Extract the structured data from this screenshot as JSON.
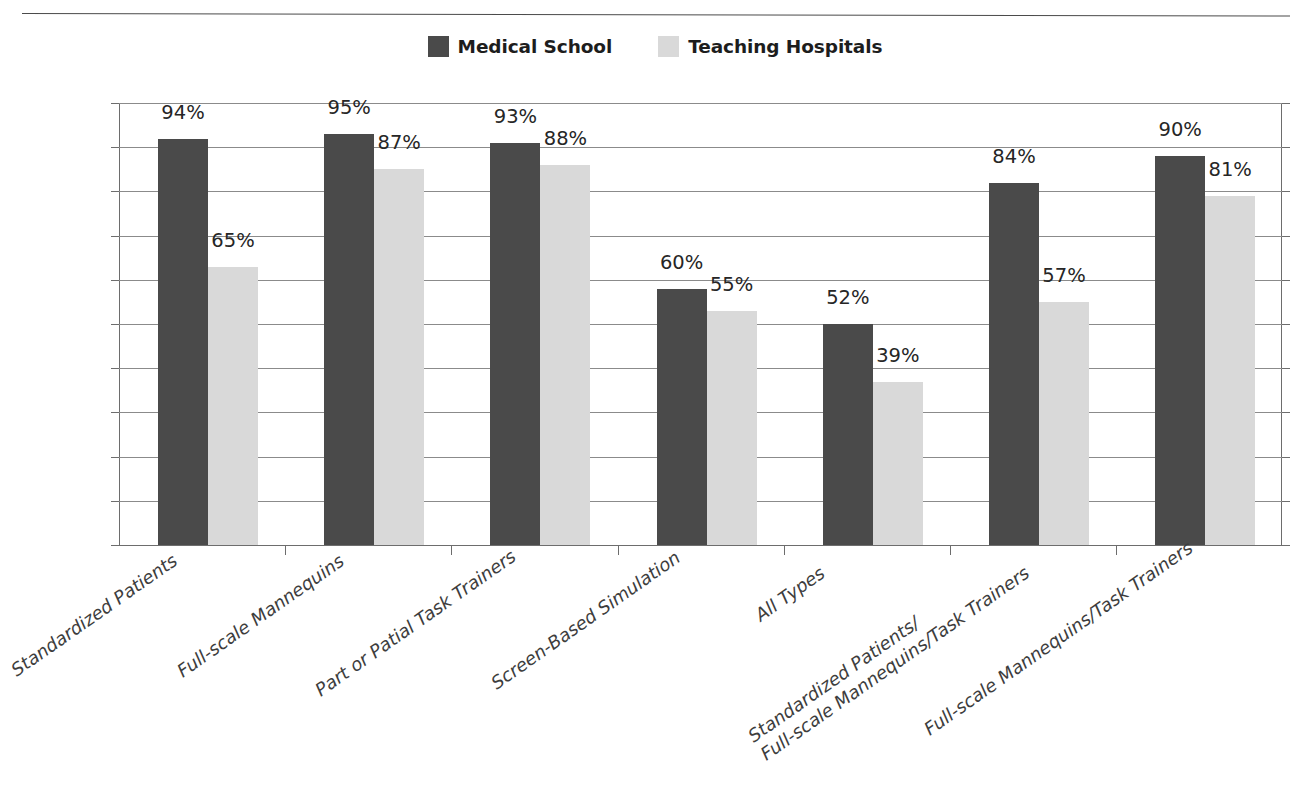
{
  "figure": {
    "top_clipped_text": "",
    "colors": {
      "medical_school": "#4a4a4a",
      "teaching_hospitals": "#d9d9d9",
      "gridline": "#8b8b8b",
      "axis": "#6d6d6d",
      "label_text": "#3d3d3d",
      "value_text": "#262626"
    }
  },
  "legend": {
    "entries": [
      {
        "label": "Medical School",
        "swatch": "#4a4a4a",
        "icon": "legend-swatch-icon"
      },
      {
        "label": "Teaching Hospitals",
        "swatch": "#d9d9d9",
        "icon": "legend-swatch-icon"
      }
    ]
  },
  "chart_data": {
    "type": "bar",
    "title": "",
    "xlabel": "",
    "ylabel": "",
    "ylim": [
      0,
      100
    ],
    "ytick_labels": [
      "100%",
      "90%",
      "80%",
      "70%",
      "60%",
      "50%",
      "40%",
      "30%",
      "20%",
      "10%",
      "0%"
    ],
    "ytick_values": [
      100,
      90,
      80,
      70,
      60,
      50,
      40,
      30,
      20,
      10,
      0
    ],
    "grid": true,
    "legend_position": "top-center",
    "value_label_suffix": "%",
    "categories": [
      "Standardized Patients",
      "Full-scale Mannequins",
      "Part or Patial Task Trainers",
      "Screen-Based Simulation",
      "All Types",
      "Standardized Patients/\nFull-scale Mannequins/Task Trainers",
      "Full-scale Mannequins/Task Trainers"
    ],
    "category_lines": [
      [
        "Standardized Patients"
      ],
      [
        "Full-scale Mannequins"
      ],
      [
        "Part or Patial Task Trainers"
      ],
      [
        "Screen-Based Simulation"
      ],
      [
        "All Types"
      ],
      [
        "Standardized Patients/",
        "Full-scale Mannequins/Task Trainers"
      ],
      [
        "Full-scale Mannequins/Task Trainers"
      ]
    ],
    "series": [
      {
        "name": "Medical School",
        "color": "#4a4a4a",
        "values": [
          94,
          95,
          93,
          60,
          52,
          84,
          90
        ],
        "labels": [
          "94%",
          "95%",
          "93%",
          "60%",
          "52%",
          "84%",
          "90%"
        ]
      },
      {
        "name": "Teaching Hospitals",
        "color": "#d9d9d9",
        "values": [
          65,
          87,
          88,
          55,
          39,
          57,
          81
        ],
        "labels": [
          "65%",
          "87%",
          "88%",
          "55%",
          "39%",
          "57%",
          "81%"
        ]
      }
    ]
  }
}
